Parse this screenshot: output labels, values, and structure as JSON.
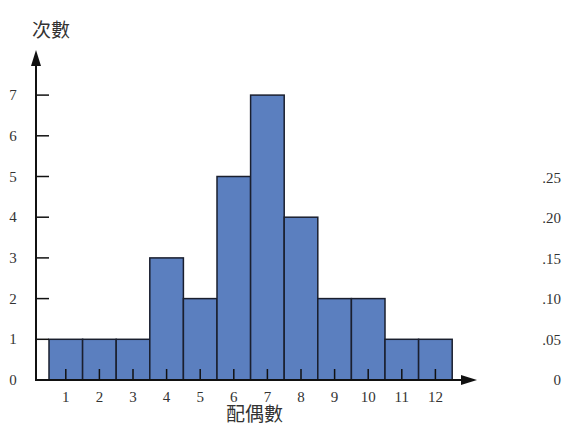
{
  "chart_data": {
    "type": "bar",
    "title": "",
    "xlabel": "配偶數",
    "ylabel": "次數",
    "categories": [
      "1",
      "2",
      "3",
      "4",
      "5",
      "6",
      "7",
      "8",
      "9",
      "10",
      "11",
      "12"
    ],
    "values": [
      1,
      1,
      1,
      3,
      2,
      5,
      7,
      4,
      2,
      2,
      1,
      1
    ],
    "ylim": [
      0,
      7
    ],
    "yticks": [
      "0",
      "1",
      "2",
      "3",
      "4",
      "5",
      "6",
      "7"
    ],
    "secondary_yaxis": {
      "label": "relative frequency",
      "ticks": [
        "0",
        ".05",
        ".10",
        ".15",
        ".20",
        ".25"
      ]
    },
    "grid": false,
    "legend": null,
    "bar_color": "#5b7fbf",
    "bar_edge_color": "#1a1f2e"
  }
}
